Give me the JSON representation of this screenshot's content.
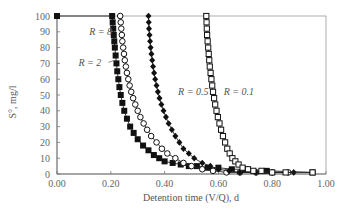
{
  "chart_data": {
    "type": "scatter",
    "title": "",
    "xlabel": "Detention time (V/Q), d",
    "ylabel": "S°, mg/l",
    "xlim": [
      0.0,
      1.0
    ],
    "ylim": [
      0,
      100
    ],
    "x_ticks": [
      "0.00",
      "0.20",
      "0.40",
      "0.60",
      "0.80",
      "1.00"
    ],
    "y_ticks": [
      "0",
      "10",
      "20",
      "30",
      "40",
      "50",
      "60",
      "70",
      "80",
      "90",
      "100"
    ],
    "grid": false,
    "legend": "inline annotations",
    "series": [
      {
        "name": "R = 8",
        "marker": "filled-square",
        "x": [
          0.0,
          0.205,
          0.207,
          0.209,
          0.211,
          0.213,
          0.215,
          0.218,
          0.221,
          0.224,
          0.228,
          0.232,
          0.237,
          0.243,
          0.25,
          0.26,
          0.272,
          0.285,
          0.3,
          0.32,
          0.34,
          0.36,
          0.38,
          0.4,
          0.43,
          0.46,
          0.49,
          0.52,
          0.56,
          0.6,
          0.65,
          0.7,
          0.78,
          0.95
        ],
        "y": [
          100,
          100,
          96,
          92,
          88,
          84,
          80,
          75,
          70,
          65,
          60,
          55,
          50,
          45,
          40,
          35,
          30,
          26,
          22,
          18,
          15,
          12,
          10,
          8,
          7,
          6,
          5,
          5,
          4,
          4,
          3,
          3,
          2,
          1
        ]
      },
      {
        "name": "R = 2",
        "marker": "open-circle",
        "x": [
          0.235,
          0.237,
          0.239,
          0.241,
          0.243,
          0.246,
          0.249,
          0.252,
          0.256,
          0.26,
          0.265,
          0.27,
          0.276,
          0.283,
          0.291,
          0.3,
          0.31,
          0.322,
          0.335,
          0.35,
          0.37,
          0.39,
          0.41,
          0.44,
          0.47,
          0.5,
          0.54,
          0.58,
          0.63,
          0.68,
          0.74,
          0.8,
          0.86
        ],
        "y": [
          100,
          96,
          92,
          88,
          84,
          80,
          76,
          72,
          68,
          64,
          60,
          56,
          52,
          48,
          44,
          40,
          36,
          32,
          28,
          24,
          20,
          16,
          13,
          10,
          7,
          5,
          3,
          2,
          1,
          1,
          1,
          1,
          1
        ]
      },
      {
        "name": "R = 0.5",
        "marker": "filled-diamond",
        "x": [
          0.34,
          0.341,
          0.342,
          0.344,
          0.346,
          0.348,
          0.351,
          0.354,
          0.357,
          0.361,
          0.365,
          0.37,
          0.375,
          0.381,
          0.388,
          0.396,
          0.405,
          0.415,
          0.427,
          0.44,
          0.455,
          0.47,
          0.49,
          0.51,
          0.54,
          0.57,
          0.6,
          0.64,
          0.68,
          0.74,
          0.8,
          0.88
        ],
        "y": [
          100,
          96,
          92,
          88,
          84,
          80,
          76,
          72,
          68,
          64,
          60,
          56,
          52,
          48,
          44,
          40,
          36,
          32,
          28,
          24,
          20,
          16,
          13,
          10,
          7,
          5,
          3,
          2,
          1,
          1,
          1,
          1
        ]
      },
      {
        "name": "R = 0.1",
        "marker": "open-square",
        "x": [
          0.555,
          0.556,
          0.557,
          0.558,
          0.56,
          0.562,
          0.564,
          0.566,
          0.568,
          0.571,
          0.574,
          0.577,
          0.58,
          0.584,
          0.588,
          0.593,
          0.598,
          0.604,
          0.61,
          0.617,
          0.625,
          0.633,
          0.642,
          0.652,
          0.663,
          0.675,
          0.69,
          0.71,
          0.73,
          0.76,
          0.8,
          0.85,
          0.95
        ],
        "y": [
          100,
          96,
          92,
          88,
          84,
          80,
          76,
          72,
          68,
          64,
          60,
          56,
          52,
          48,
          44,
          40,
          36,
          32,
          28,
          24,
          20,
          16,
          13,
          10,
          8,
          6,
          4,
          3,
          2,
          2,
          1,
          1,
          1
        ]
      }
    ],
    "annotations": [
      {
        "text": "R = 8",
        "x": 0.12,
        "y": 90
      },
      {
        "text": "R = 2",
        "x": 0.08,
        "y": 70
      },
      {
        "text": "R = 0.5",
        "x": 0.45,
        "y": 52
      },
      {
        "text": "R = 0.1",
        "x": 0.62,
        "y": 52
      }
    ]
  }
}
